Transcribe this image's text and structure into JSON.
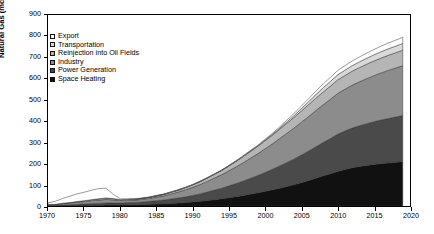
{
  "chart_data": {
    "type": "area",
    "stacked": true,
    "title": "",
    "xlabel": "",
    "ylabel": "Natural Gas (mcm/d)",
    "xlim": [
      1970,
      2020
    ],
    "ylim": [
      0,
      900
    ],
    "ytick_values": [
      0,
      100,
      200,
      300,
      400,
      500,
      600,
      700,
      800,
      900
    ],
    "xtick_values": [
      1970,
      1975,
      1980,
      1985,
      1990,
      1995,
      2000,
      2005,
      2010,
      2015,
      2020
    ],
    "grid": false,
    "legend_position": "upper left",
    "x": [
      1970,
      1971,
      1972,
      1973,
      1974,
      1975,
      1976,
      1977,
      1978,
      1979,
      1980,
      1981,
      1982,
      1983,
      1984,
      1985,
      1986,
      1987,
      1988,
      1989,
      1990,
      1991,
      1992,
      1993,
      1994,
      1995,
      1996,
      1997,
      1998,
      1999,
      2000,
      2001,
      2002,
      2003,
      2004,
      2005,
      2006,
      2007,
      2008,
      2009,
      2010,
      2011,
      2012,
      2013,
      2014,
      2015,
      2016,
      2017,
      2018,
      2019
    ],
    "series": [
      {
        "name": "Space Heating",
        "color": "#111111",
        "values": [
          1,
          1,
          2,
          2,
          3,
          3,
          4,
          4,
          5,
          5,
          5,
          6,
          6,
          7,
          8,
          9,
          10,
          12,
          14,
          16,
          19,
          22,
          26,
          30,
          34,
          39,
          44,
          50,
          56,
          62,
          69,
          76,
          84,
          92,
          101,
          110,
          120,
          131,
          142,
          152,
          163,
          172,
          180,
          186,
          191,
          196,
          200,
          203,
          206,
          209
        ]
      },
      {
        "name": "Power Generation",
        "color": "#4a4a4a",
        "values": [
          2,
          2,
          3,
          4,
          5,
          6,
          7,
          8,
          9,
          9,
          9,
          10,
          11,
          12,
          14,
          16,
          18,
          21,
          24,
          27,
          31,
          35,
          40,
          45,
          50,
          56,
          62,
          68,
          75,
          82,
          89,
          97,
          105,
          113,
          121,
          130,
          139,
          148,
          157,
          166,
          175,
          181,
          187,
          192,
          197,
          201,
          205,
          209,
          213,
          217
        ]
      },
      {
        "name": "Industry",
        "color": "#8c8c8c",
        "values": [
          3,
          4,
          6,
          8,
          10,
          12,
          14,
          16,
          17,
          15,
          12,
          11,
          11,
          12,
          14,
          17,
          20,
          24,
          28,
          33,
          38,
          44,
          50,
          57,
          64,
          71,
          79,
          87,
          95,
          103,
          112,
          120,
          129,
          138,
          146,
          155,
          163,
          171,
          178,
          185,
          192,
          197,
          202,
          207,
          212,
          217,
          222,
          227,
          231,
          235
        ]
      },
      {
        "name": "Reinjection into Oil Fields",
        "color": "#b5b5b5",
        "values": [
          1,
          1,
          2,
          2,
          3,
          4,
          5,
          6,
          7,
          6,
          4,
          4,
          4,
          5,
          5,
          6,
          7,
          8,
          9,
          11,
          12,
          14,
          16,
          18,
          20,
          23,
          26,
          29,
          32,
          35,
          38,
          41,
          44,
          47,
          50,
          53,
          56,
          58,
          60,
          62,
          64,
          65,
          66,
          67,
          68,
          69,
          70,
          71,
          72,
          73
        ]
      },
      {
        "name": "Transportation",
        "color": "#d9d9d9",
        "values": [
          0,
          0,
          0,
          0,
          0,
          0,
          0,
          0,
          0,
          0,
          0,
          0,
          0,
          0,
          0,
          0,
          0,
          0,
          0,
          0,
          0,
          0,
          0,
          0,
          0,
          1,
          1,
          1,
          2,
          2,
          3,
          4,
          5,
          7,
          9,
          11,
          14,
          17,
          20,
          22,
          24,
          25,
          26,
          27,
          28,
          29,
          30,
          31,
          31,
          32
        ]
      },
      {
        "name": "Export",
        "color": "#ffffff",
        "values": [
          8,
          14,
          22,
          30,
          36,
          40,
          44,
          48,
          46,
          20,
          4,
          2,
          2,
          2,
          2,
          2,
          2,
          2,
          2,
          2,
          2,
          2,
          2,
          2,
          2,
          2,
          2,
          3,
          3,
          3,
          4,
          5,
          6,
          8,
          10,
          12,
          14,
          16,
          18,
          19,
          20,
          21,
          22,
          23,
          24,
          25,
          26,
          27,
          28,
          29
        ]
      }
    ],
    "annotations": [
      {
        "label": "Revolution",
        "year": 1979,
        "line": true
      },
      {
        "label": "Rafsanjani",
        "year": 1989,
        "line": true
      },
      {
        "label": "Khatami",
        "year": 1997,
        "line": true
      },
      {
        "label": "Ahmadinejad",
        "year": 2005,
        "line": true
      },
      {
        "label": "Rouhani",
        "year": 2013,
        "line": true
      }
    ]
  },
  "legend": {
    "items": [
      {
        "label": "Export",
        "color": "#ffffff"
      },
      {
        "label": "Transportation",
        "color": "#d9d9d9"
      },
      {
        "label": "Reinjection into Oil Fields",
        "color": "#b5b5b5"
      },
      {
        "label": "Industry",
        "color": "#8c8c8c"
      },
      {
        "label": "Power Generation",
        "color": "#4a4a4a"
      },
      {
        "label": "Space Heating",
        "color": "#111111"
      }
    ]
  }
}
